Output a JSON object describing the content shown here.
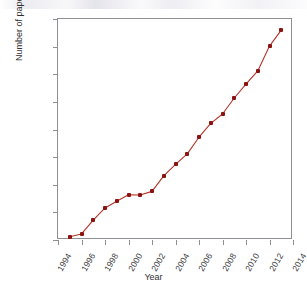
{
  "chart_data": {
    "type": "line",
    "title": "",
    "xlabel": "Year",
    "ylabel": "Number of papers",
    "xlim": [
      1994,
      2014
    ],
    "ylim": [
      0,
      4000
    ],
    "grid": false,
    "legend": "none",
    "line_color": "#b5342a",
    "marker_color": "#8c1410",
    "x_tick_labels": [
      "1994",
      "1996",
      "1998",
      "2000",
      "2002",
      "2004",
      "2006",
      "2008",
      "2010",
      "2012",
      "2014"
    ],
    "y_tick_labels": [
      "0",
      "500",
      "1000",
      "1500",
      "2000",
      "2500",
      "3000",
      "3500",
      "4000"
    ],
    "x_ticks": [
      1994,
      1996,
      1998,
      2000,
      2002,
      2004,
      2006,
      2008,
      2010,
      2012,
      2014
    ],
    "y_ticks": [
      0,
      500,
      1000,
      1500,
      2000,
      2500,
      3000,
      3500,
      4000
    ],
    "x": [
      1995,
      1996,
      1997,
      1998,
      1999,
      2000,
      2001,
      2002,
      2003,
      2004,
      2005,
      2006,
      2007,
      2008,
      2009,
      2010,
      2011,
      2012,
      2013
    ],
    "values": [
      60,
      110,
      360,
      580,
      700,
      820,
      815,
      880,
      1160,
      1370,
      1560,
      1860,
      2110,
      2280,
      2570,
      2820,
      3060,
      3510,
      3800
    ]
  }
}
